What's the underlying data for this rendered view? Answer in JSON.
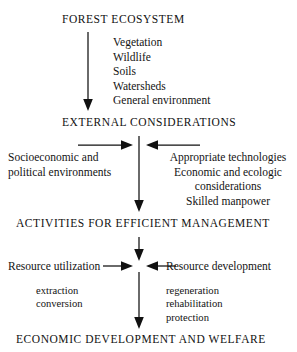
{
  "diagram": {
    "title": "FOREST ECOSYSTEM",
    "type": "flowchart",
    "orientation": "top-to-bottom",
    "stages": [
      {
        "id": "forest-ecosystem",
        "heading": "FOREST ECOSYSTEM",
        "components": [
          "Vegetation",
          "Wildlife",
          "Soils",
          "Watersheds",
          "General environment"
        ]
      },
      {
        "id": "external-considerations",
        "heading": "EXTERNAL  CONSIDERATIONS",
        "left_input": {
          "lines": [
            "Socioeconomic and",
            "political environments"
          ]
        },
        "right_input": {
          "lines": [
            "Appropriate technologies",
            "Economic and ecologic",
            "considerations",
            "Skilled manpower"
          ]
        }
      },
      {
        "id": "activities-for-efficient-management",
        "heading": "ACTIVITIES  FOR  EFFICIENT  MANAGEMENT",
        "left_input": {
          "label": "Resource utilization",
          "details": [
            "extraction",
            "conversion"
          ]
        },
        "right_input": {
          "label": "Resource development",
          "details": [
            "regeneration",
            "rehabilitation",
            "protection"
          ]
        }
      },
      {
        "id": "economic-development-and-welfare",
        "heading": "ECONOMIC  DEVELOPMENT  AND  WELFARE"
      }
    ],
    "colors": {
      "background": "#ffffff",
      "text": "#111111",
      "arrow": "#111111"
    }
  }
}
